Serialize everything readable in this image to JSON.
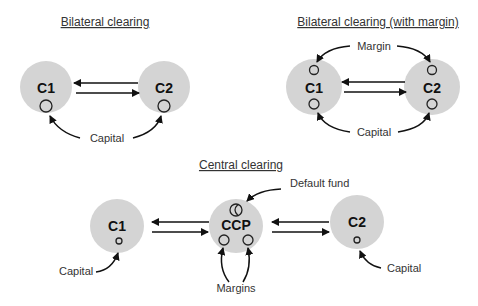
{
  "panels": {
    "bilateral": {
      "title": "Bilateral clearing",
      "nodes": [
        {
          "label": "C1"
        },
        {
          "label": "C2"
        }
      ],
      "annotations": {
        "capital": "Capital"
      }
    },
    "bilateral_margin": {
      "title": "Bilateral clearing (with margin)",
      "nodes": [
        {
          "label": "C1"
        },
        {
          "label": "C2"
        }
      ],
      "annotations": {
        "margin": "Margin",
        "capital": "Capital"
      }
    },
    "central": {
      "title": "Central clearing",
      "nodes": [
        {
          "label": "C1"
        },
        {
          "label": "CCP"
        },
        {
          "label": "C2"
        }
      ],
      "annotations": {
        "default_fund": "Default fund",
        "margins": "Margins",
        "capital_left": "Capital",
        "capital_right": "Capital"
      }
    }
  },
  "colors": {
    "node_fill": "#d4d4d4",
    "stroke": "#111111",
    "text": "#333333"
  }
}
